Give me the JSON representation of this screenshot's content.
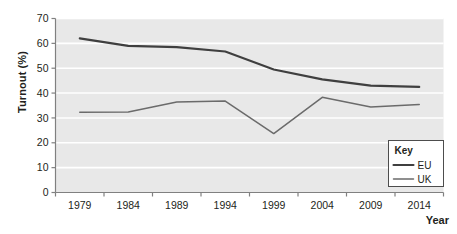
{
  "chart_data": {
    "type": "line",
    "title": "",
    "xlabel": "Year",
    "ylabel": "Turnout (%)",
    "categories": [
      "1979",
      "1984",
      "1989",
      "1994",
      "1999",
      "2004",
      "2009",
      "2014"
    ],
    "x": [
      1979,
      1984,
      1989,
      1994,
      1999,
      2004,
      2009,
      2014
    ],
    "series": [
      {
        "name": "EU",
        "values": [
          62.0,
          59.0,
          58.5,
          56.7,
          49.5,
          45.5,
          43.0,
          42.5
        ],
        "color": "#3f3f3f",
        "line_width": 2.1
      },
      {
        "name": "UK",
        "values": [
          32.3,
          32.4,
          36.4,
          36.8,
          23.7,
          38.3,
          34.4,
          35.4
        ],
        "color": "#6b6b6b",
        "line_width": 1.5
      }
    ],
    "ylim": [
      0,
      70
    ],
    "yticks": [
      0,
      10,
      20,
      30,
      40,
      50,
      60,
      70
    ],
    "ytick_labels": [
      "0",
      "10",
      "20",
      "30",
      "40",
      "50",
      "60",
      "70"
    ],
    "xtick_labels": [
      "1979",
      "1984",
      "1989",
      "1994",
      "1999",
      "2004",
      "2009",
      "2014"
    ],
    "grid": true,
    "grid_color": "#ffffff",
    "plot_background": "#e8e8e8",
    "axis_color": "#808080",
    "legend_position": "bottom-right"
  },
  "legend": {
    "title": "Key",
    "entries": [
      {
        "label": "EU"
      },
      {
        "label": "UK"
      }
    ]
  },
  "axes": {
    "y_title": "Turnout (%)",
    "x_title": "Year"
  }
}
